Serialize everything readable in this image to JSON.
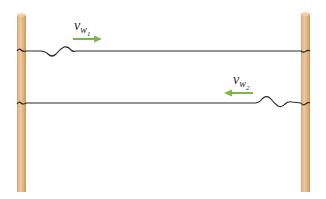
{
  "diagram": {
    "colors": {
      "pole": "#e3b98a",
      "pole_shadow": "#c9975f",
      "rope": "#2a2a2a",
      "arrow": "#7ab648",
      "background": "#ffffff"
    },
    "poles": [
      {
        "name": "left-pole",
        "x": 17,
        "width": 9,
        "top": 14,
        "bottom": 192
      },
      {
        "name": "right-pole",
        "x": 301,
        "width": 9,
        "top": 13,
        "bottom": 192
      }
    ],
    "ropes": [
      {
        "name": "top-rope",
        "y": 51,
        "pulse_position": "near-left",
        "label": {
          "symbol": "v",
          "sub": "w",
          "subsub": "1"
        },
        "arrow_direction": "right"
      },
      {
        "name": "bottom-rope",
        "y": 103,
        "pulse_position": "near-right",
        "label": {
          "symbol": "v",
          "sub": "w",
          "subsub": "2"
        },
        "arrow_direction": "left"
      }
    ]
  }
}
